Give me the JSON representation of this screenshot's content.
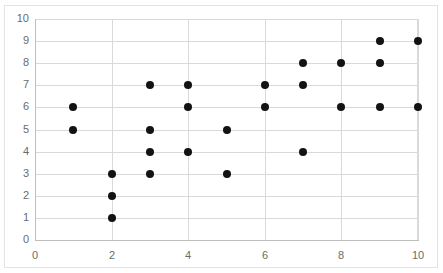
{
  "chart_data": {
    "type": "scatter",
    "title": "",
    "xlabel": "",
    "ylabel": "",
    "xlim": [
      0,
      10
    ],
    "ylim": [
      0,
      10
    ],
    "grid": true,
    "legend": "none",
    "x_tick_labels": [
      "0",
      "2",
      "4",
      "6",
      "8",
      "10"
    ],
    "x_tick_values": [
      0,
      2,
      4,
      6,
      8,
      10
    ],
    "y_tick_labels": [
      "0",
      "1",
      "2",
      "3",
      "4",
      "5",
      "6",
      "7",
      "8",
      "9",
      "10"
    ],
    "y_tick_values": [
      0,
      1,
      2,
      3,
      4,
      5,
      6,
      7,
      8,
      9,
      10
    ],
    "marker_color": "#131313",
    "marker_shape": "circle",
    "gridline_color": "#d9d9d9",
    "axis_color": "#bfbfbf",
    "series": [
      {
        "name": "points",
        "points": [
          [
            1,
            6
          ],
          [
            1,
            5
          ],
          [
            2,
            3
          ],
          [
            2,
            2
          ],
          [
            2,
            1
          ],
          [
            3,
            7
          ],
          [
            3,
            5
          ],
          [
            3,
            4
          ],
          [
            3,
            3
          ],
          [
            4,
            7
          ],
          [
            4,
            6
          ],
          [
            4,
            4
          ],
          [
            5,
            5
          ],
          [
            5,
            3
          ],
          [
            6,
            7
          ],
          [
            6,
            6
          ],
          [
            7,
            8
          ],
          [
            7,
            7
          ],
          [
            7,
            4
          ],
          [
            8,
            8
          ],
          [
            8,
            6
          ],
          [
            9,
            9
          ],
          [
            9,
            8
          ],
          [
            9,
            6
          ],
          [
            10,
            9
          ],
          [
            10,
            6
          ]
        ]
      }
    ]
  },
  "axes": {
    "y_labels": [
      "10",
      "9",
      "8",
      "7",
      "6",
      "5",
      "4",
      "3",
      "2",
      "1",
      "0"
    ],
    "x_labels": [
      "0",
      "2",
      "4",
      "6",
      "8",
      "10"
    ]
  },
  "title_sliver": {
    "text": ""
  }
}
